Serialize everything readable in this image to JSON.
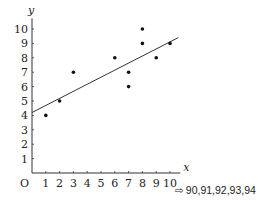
{
  "chart_data": {
    "type": "scatter",
    "title": "",
    "xlabel": "x",
    "ylabel": "y",
    "origin_label": "O",
    "xlim": [
      0,
      10.6
    ],
    "ylim": [
      0,
      10.6
    ],
    "x_ticks": [
      1,
      2,
      3,
      4,
      5,
      6,
      7,
      8,
      9,
      10
    ],
    "y_ticks": [
      1,
      2,
      3,
      4,
      5,
      6,
      7,
      8,
      9,
      10
    ],
    "grid": false,
    "points": [
      {
        "x": 1,
        "y": 4
      },
      {
        "x": 2,
        "y": 5
      },
      {
        "x": 3,
        "y": 7
      },
      {
        "x": 6,
        "y": 8
      },
      {
        "x": 7,
        "y": 7
      },
      {
        "x": 7,
        "y": 6
      },
      {
        "x": 8,
        "y": 10
      },
      {
        "x": 8,
        "y": 9
      },
      {
        "x": 9,
        "y": 8
      },
      {
        "x": 10,
        "y": 9
      }
    ],
    "trend_line": {
      "x1": 0,
      "y1": 4.2,
      "x2": 10.6,
      "y2": 9.4
    }
  },
  "annotation": {
    "arrow": "⇨",
    "text": "90,91,92,93,94"
  }
}
